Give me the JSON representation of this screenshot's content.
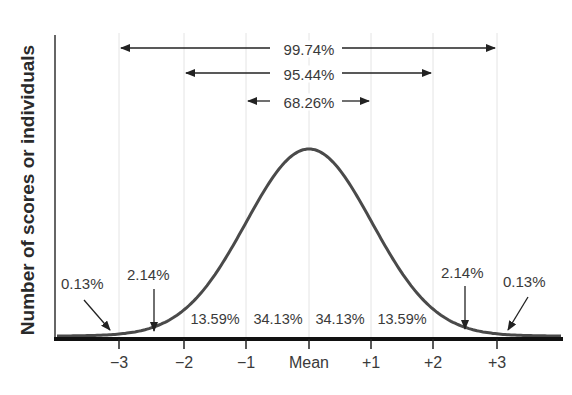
{
  "chart_data": {
    "type": "line",
    "title": "",
    "xlabel": "",
    "ylabel": "Number of scores or individuals",
    "x_ticks": [
      "−3",
      "−2",
      "−1",
      "Mean",
      "+1",
      "+2",
      "+3"
    ],
    "x_tick_values": [
      -3,
      -2,
      -1,
      0,
      1,
      2,
      3
    ],
    "xlim": [
      -4,
      4
    ],
    "grid": "vertical lines at each standard deviation",
    "legend": "none",
    "series": [
      {
        "name": "Normal distribution",
        "function": "standard normal density",
        "mean": 0,
        "sd": 1
      }
    ],
    "spans": [
      {
        "label": "68.26%",
        "from": -1,
        "to": 1
      },
      {
        "label": "95.44%",
        "from": -2,
        "to": 2
      },
      {
        "label": "99.74%",
        "from": -3,
        "to": 3
      }
    ],
    "region_labels": [
      {
        "label": "13.59%",
        "from": -2,
        "to": -1
      },
      {
        "label": "34.13%",
        "from": -1,
        "to": 0
      },
      {
        "label": "34.13%",
        "from": 0,
        "to": 1
      },
      {
        "label": "13.59%",
        "from": 1,
        "to": 2
      }
    ],
    "tail_annotations": [
      {
        "label": "0.13%",
        "region": "below -3",
        "side": "left"
      },
      {
        "label": "2.14%",
        "region": "-3 to -2",
        "side": "left"
      },
      {
        "label": "2.14%",
        "region": "+2 to +3",
        "side": "right"
      },
      {
        "label": "0.13%",
        "region": "above +3",
        "side": "right"
      }
    ]
  },
  "labels": {
    "ylabel": "Number of scores or individuals",
    "ticks": [
      "−3",
      "−2",
      "−1",
      "Mean",
      "+1",
      "+2",
      "+3"
    ],
    "span_99": "99.74%",
    "span_95": "95.44%",
    "span_68": "68.26%",
    "region_1": "13.59%",
    "region_2": "34.13%",
    "region_3": "34.13%",
    "region_4": "13.59%",
    "tail_left_outer": "0.13%",
    "tail_left_inner": "2.14%",
    "tail_right_inner": "2.14%",
    "tail_right_outer": "0.13%"
  },
  "colors": {
    "curve": "#4a4a4a",
    "axis": "#1a1a1a",
    "grid": "#e2e2e2",
    "text": "#3a3a3a"
  }
}
